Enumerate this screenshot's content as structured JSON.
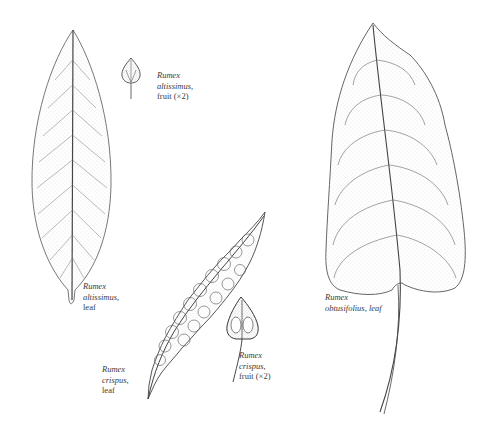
{
  "figure": {
    "background": "#ffffff",
    "ink_color": "#3a3a3a",
    "items": [
      {
        "id": "altissimus-leaf",
        "species": "Rumex",
        "epithet": "altissimus,",
        "part": "leaf"
      },
      {
        "id": "altissimus-fruit",
        "species": "Rumex",
        "epithet": "altissimus,",
        "part": "fruit (×2)"
      },
      {
        "id": "crispus-leaf",
        "species": "Rumex",
        "epithet": "crispus,",
        "part": "leaf"
      },
      {
        "id": "crispus-fruit",
        "species": "Rumex",
        "epithet": "crispus,",
        "part": "fruit (×2)"
      },
      {
        "id": "obtusifolius-leaf",
        "species": "Rumex",
        "epithet": "obtusifolius, leaf"
      }
    ]
  }
}
